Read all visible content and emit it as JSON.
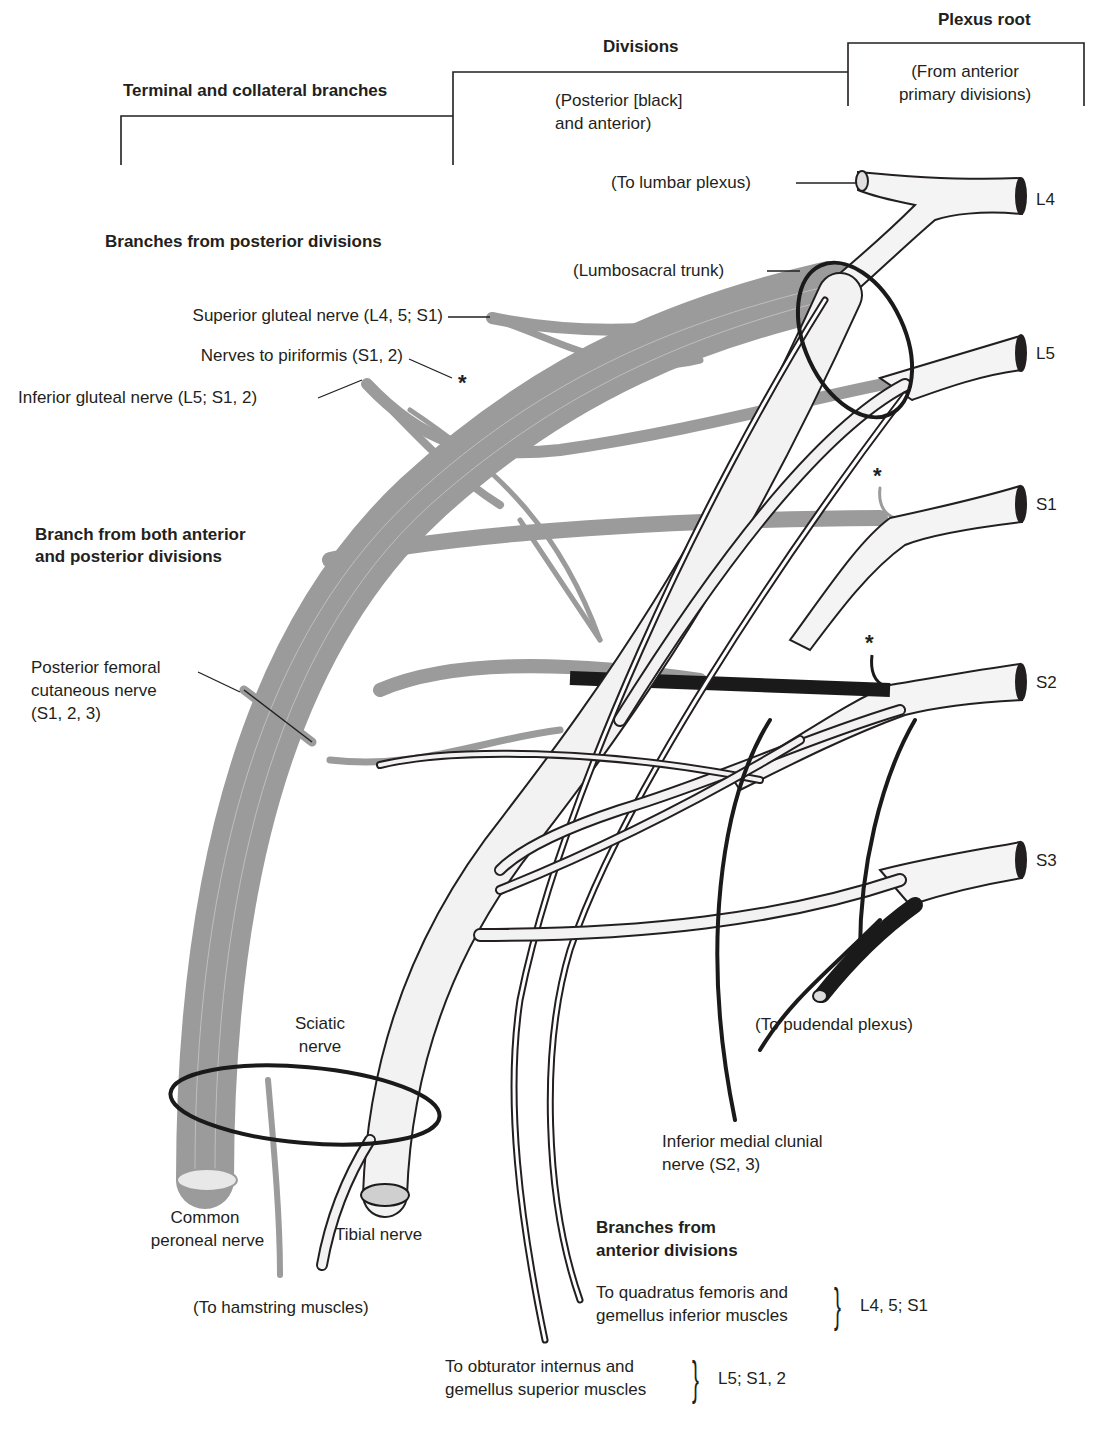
{
  "figure": {
    "colors": {
      "posterior_division": "#9b9b9b",
      "anterior_division": "#f2f2f2",
      "pudendal_black": "#1a1a1a",
      "outline": "#231f20",
      "background": "#ffffff"
    }
  },
  "column_headers": {
    "plexus_root": {
      "title": "Plexus root",
      "subtitle_line1": "(From anterior",
      "subtitle_line2": "primary divisions)"
    },
    "divisions": {
      "title": "Divisions",
      "subtitle_line1": "(Posterior [black]",
      "subtitle_line2": "and anterior)"
    },
    "terminal": {
      "title": "Terminal and collateral branches"
    }
  },
  "roots": [
    {
      "label": "L4"
    },
    {
      "label": "L5"
    },
    {
      "label": "S1"
    },
    {
      "label": "S2"
    },
    {
      "label": "S3"
    }
  ],
  "root_labels": {
    "to_lumbar_plexus": "(To lumbar plexus)",
    "lumbosacral_trunk": "(Lumbosacral trunk)",
    "to_pudendal_plexus": "(To pudendal plexus)"
  },
  "section_posterior": {
    "heading": "Branches from posterior divisions",
    "items": [
      {
        "label": "Superior gluteal nerve (L4, 5; S1)"
      },
      {
        "label": "Nerves to piriformis (S1, 2)"
      },
      {
        "label": "Inferior gluteal nerve (L5; S1, 2)"
      }
    ],
    "asterisk": "*"
  },
  "section_both": {
    "heading_line1": "Branch from both anterior",
    "heading_line2": "and posterior divisions",
    "item_line1": "Posterior femoral",
    "item_line2": "cutaneous nerve",
    "item_line3": "(S1, 2, 3)"
  },
  "terminal_labels": {
    "sciatic_line1": "Sciatic",
    "sciatic_line2": "nerve",
    "common_peroneal_line1": "Common",
    "common_peroneal_line2": "peroneal nerve",
    "tibial": "Tibial nerve",
    "to_hamstring": "(To hamstring muscles)",
    "inferior_medial_clunial_line1": "Inferior medial clunial",
    "inferior_medial_clunial_line2": "nerve (S2, 3)"
  },
  "section_anterior": {
    "heading_line1": "Branches from",
    "heading_line2": "anterior divisions",
    "items": [
      {
        "line1": "To quadratus femoris and",
        "line2": "gemellus inferior muscles",
        "segments": "L4, 5; S1"
      },
      {
        "line1": "To obturator internus and",
        "line2": "gemellus superior muscles",
        "segments": "L5; S1, 2"
      }
    ]
  },
  "asterisk": "*"
}
